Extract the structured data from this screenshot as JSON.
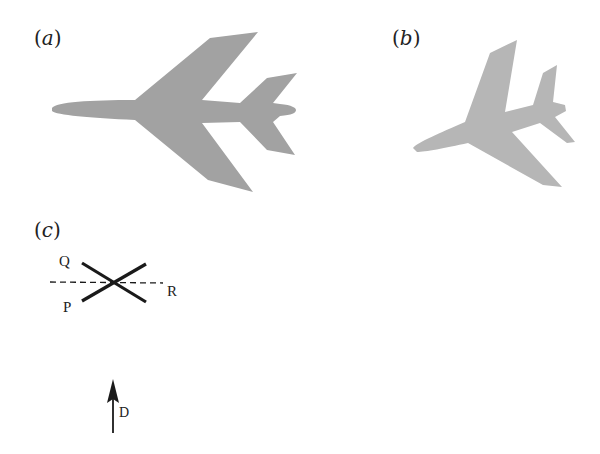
{
  "panels": {
    "a": {
      "open": "(",
      "letter": "a",
      "close": ")"
    },
    "b": {
      "open": "(",
      "letter": "b",
      "close": ")"
    },
    "c": {
      "open": "(",
      "letter": "c",
      "close": ")"
    }
  },
  "crossing_diagram": {
    "labels": {
      "q": "Q",
      "p": "P",
      "r": "R"
    }
  },
  "direction_arrow": {
    "label": "D"
  },
  "colors": {
    "plane_a_fill": "#a2a2a2",
    "plane_b_fill": "#b6b6b6",
    "ink": "#1a1a1a"
  }
}
